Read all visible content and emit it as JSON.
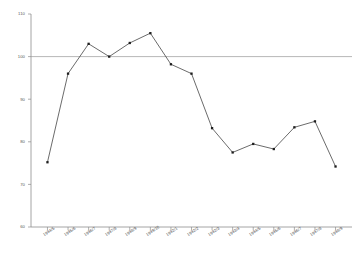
{
  "chart_data": {
    "type": "line",
    "title": "",
    "subtitle": "",
    "xlabel": "",
    "ylabel": "",
    "ylim": [
      60,
      110
    ],
    "yticks": [
      60,
      70,
      80,
      90,
      100,
      110
    ],
    "ytick_labels": [
      "60",
      "70",
      "80",
      "90",
      "100",
      "110"
    ],
    "grid": false,
    "legend": null,
    "categories": [
      "1994/5",
      "1995/6",
      "1996/7",
      "1997/8",
      "1998/9",
      "1999/10",
      "1992/1",
      "1992/2",
      "1992/3",
      "1993/4",
      "1994/5",
      "1995/6",
      "1996/7",
      "1997/8",
      "1998/9"
    ],
    "values": [
      75.2,
      96.0,
      103.0,
      100.0,
      103.2,
      105.5,
      98.2,
      96.0,
      83.2,
      77.5,
      79.5,
      78.3,
      83.4,
      84.8,
      74.2
    ],
    "series": [
      {
        "name": "index",
        "values": [
          75.2,
          96.0,
          103.0,
          100.0,
          103.2,
          105.5,
          98.2,
          96.0,
          83.2,
          77.5,
          79.5,
          78.3,
          83.4,
          84.8,
          74.2
        ]
      }
    ],
    "reference_line": {
      "value": 100,
      "orientation": "horizontal"
    },
    "colors": {
      "line": "#3a3a3a",
      "marker": "#1e1e1e",
      "axis": "#8d8d8d",
      "reference": "#9a9a9a",
      "background": "#ffffff"
    }
  }
}
